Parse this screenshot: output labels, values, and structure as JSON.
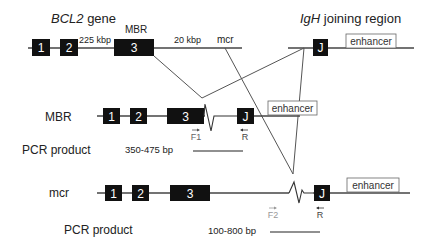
{
  "top": {
    "bcl2_gene_italic": "BCL2",
    "bcl2_gene_suffix": " gene",
    "igh_italic": "IgH",
    "igh_suffix": " joining region",
    "exons": [
      "1",
      "2",
      "3"
    ],
    "distance_1": "225 kbp",
    "distance_2": "20 kbp",
    "mbr_label": "MBR",
    "mcr_label": "mcr",
    "j_label": "J",
    "enhancer_label": "enhancer"
  },
  "mbr_row": {
    "label": "MBR",
    "exons": [
      "1",
      "2",
      "3"
    ],
    "j_label": "J",
    "enhancer_label": "enhancer",
    "primer_forward": "F1",
    "primer_reverse": "R",
    "pcr_label": "PCR product",
    "pcr_size": "350-475 bp"
  },
  "mcr_row": {
    "label": "mcr",
    "exons": [
      "1",
      "2",
      "3"
    ],
    "j_label": "J",
    "enhancer_label": "enhancer",
    "primer_forward": "F2",
    "primer_reverse": "R",
    "pcr_label": "PCR product",
    "pcr_size": "100-800 bp"
  },
  "colors": {
    "exon_fill": "#111111",
    "line": "#444444",
    "primer_f2": "#999999"
  }
}
